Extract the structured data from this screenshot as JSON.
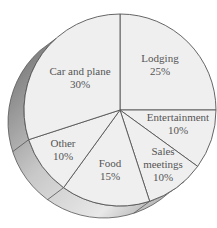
{
  "chart_data": {
    "type": "pie",
    "title": "",
    "style": "3d-pie",
    "categories": [
      "Lodging",
      "Entertainment",
      "Sales meetings",
      "Food",
      "Other",
      "Car and plane"
    ],
    "values": [
      25,
      10,
      10,
      15,
      10,
      30
    ],
    "unit": "%",
    "labels": [
      {
        "name": "Lodging",
        "lines": [
          "Lodging",
          "25%"
        ],
        "x": 160,
        "y": 62
      },
      {
        "name": "Entertainment",
        "lines": [
          "Entertainment",
          "10%"
        ],
        "x": 178,
        "y": 121
      },
      {
        "name": "Sales meetings",
        "lines": [
          "Sales",
          "meetings",
          "10%"
        ],
        "x": 163,
        "y": 155
      },
      {
        "name": "Food",
        "lines": [
          "Food",
          "15%"
        ],
        "x": 110,
        "y": 167
      },
      {
        "name": "Other",
        "lines": [
          "Other",
          "10%"
        ],
        "x": 63,
        "y": 147
      },
      {
        "name": "Car and plane",
        "lines": [
          "Car and plane",
          "30%"
        ],
        "x": 80,
        "y": 75
      }
    ],
    "start_angle_deg": 0,
    "direction": "clockwise",
    "legend": "none",
    "colors": {
      "face": "#efefef",
      "edge": "#555555",
      "side_dark": "#707070",
      "side_light": "#e0e0e0",
      "text": "#555555"
    }
  }
}
